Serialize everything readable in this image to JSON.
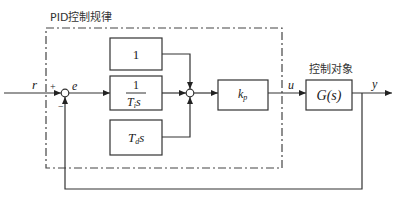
{
  "diagram": {
    "type": "block-diagram",
    "pid_region": {
      "label": "PID控制规律"
    },
    "plant_region": {
      "label": "控制对象"
    },
    "signals": {
      "reference": "r",
      "error": "e",
      "control": "u",
      "output": "y",
      "plus_sign": "+",
      "minus_sign": "−"
    },
    "blocks": {
      "proportional": {
        "label": "1"
      },
      "integral": {
        "numerator": "1",
        "denominator_T": "T",
        "denominator_sub": "i",
        "denominator_s": "s"
      },
      "derivative": {
        "T": "T",
        "sub": "d",
        "s": "s"
      },
      "gain": {
        "k": "k",
        "sub": "p"
      },
      "plant": {
        "label": "G(s)"
      }
    },
    "colors": {
      "stroke": "#333333",
      "background": "#ffffff"
    }
  }
}
